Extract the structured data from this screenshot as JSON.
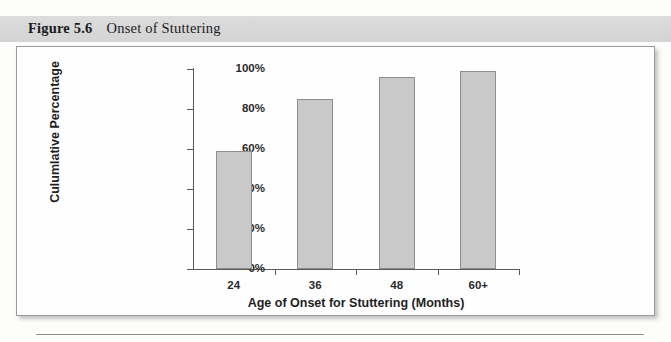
{
  "figure": {
    "label": "Figure 5.6",
    "title": "Onset of Stuttering"
  },
  "chart_data": {
    "type": "bar",
    "title": "Onset of Stuttering",
    "categories": [
      "24",
      "36",
      "48",
      "60+"
    ],
    "values": [
      59,
      85,
      96,
      99
    ],
    "xlabel": "Age of Onset for Stuttering (Months)",
    "ylabel": "Culumlative Percentage",
    "ylim": [
      0,
      100
    ],
    "yticks": [
      "0%",
      "20%",
      "40%",
      "60%",
      "80%",
      "100%"
    ],
    "ytick_values": [
      0,
      20,
      40,
      60,
      80,
      100
    ],
    "grid": false,
    "legend": "none",
    "bar_fill": "#c9c9c9",
    "bar_border": "#8d8d8d",
    "axis_color": "#5a5a5a"
  }
}
